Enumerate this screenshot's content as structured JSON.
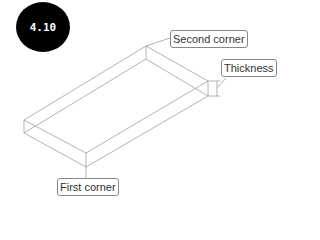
{
  "badge": {
    "text": "4.10"
  },
  "labels": {
    "second_corner": "Second corner",
    "thickness": "Thickness",
    "first_corner": "First corner"
  },
  "colors": {
    "line": "#999999",
    "badge_bg": "#000000",
    "badge_text": "#ffffff"
  }
}
